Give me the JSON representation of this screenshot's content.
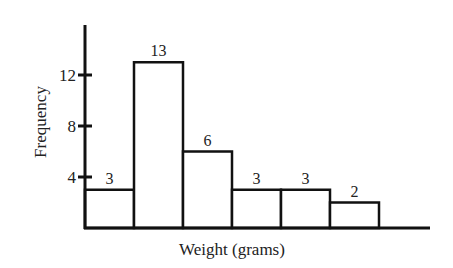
{
  "chart_data": {
    "type": "bar",
    "title": "",
    "xlabel": "Weight (grams)",
    "ylabel": "Frequency",
    "categories": [
      "bin1",
      "bin2",
      "bin3",
      "bin4",
      "bin5",
      "bin6"
    ],
    "values": [
      3,
      13,
      6,
      3,
      3,
      2
    ],
    "data_labels": [
      "3",
      "13",
      "6",
      "3",
      "3",
      "2"
    ],
    "yticks": [
      4,
      8,
      12
    ],
    "ytick_labels": [
      "4",
      "8",
      "12"
    ],
    "ylim": [
      0,
      16
    ],
    "grid": false,
    "legend": null,
    "histogram": true
  },
  "colors": {
    "stroke": "#111111",
    "fill": "#ffffff",
    "text": "#222222"
  }
}
